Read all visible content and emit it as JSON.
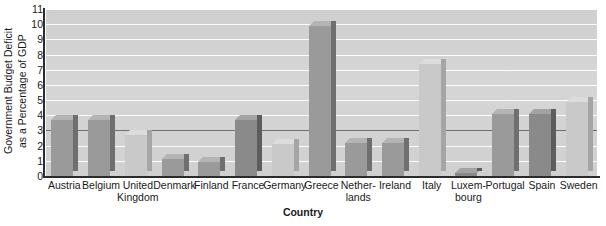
{
  "chart_data": {
    "type": "bar",
    "title": "",
    "xlabel": "Country",
    "ylabel": "Government Budget Deficit as a Percentage of GDP",
    "ylabel_line1": "Government Budget Deficit",
    "ylabel_line2": "as a Percentage of GDP",
    "ylim": [
      0,
      11
    ],
    "ytick_labels": [
      "0",
      "1",
      "2",
      "3",
      "4",
      "5",
      "6",
      "7",
      "8",
      "9",
      "10",
      "11"
    ],
    "ytick_values": [
      0,
      1,
      2,
      3,
      4,
      5,
      6,
      7,
      8,
      9,
      10,
      11
    ],
    "grid": true,
    "legend": "none",
    "reference_line": 3,
    "categories": [
      "Austria",
      "Belgium",
      "United Kingdom",
      "Denmark",
      "Finland",
      "France",
      "Germany",
      "Greece",
      "Netherlands",
      "Ireland",
      "Italy",
      "Luxembourg",
      "Portugal",
      "Spain",
      "Sweden"
    ],
    "category_lines": [
      [
        "Austria"
      ],
      [
        "Belgium"
      ],
      [
        "United",
        "Kingdom"
      ],
      [
        "Denmark"
      ],
      [
        "Finland"
      ],
      [
        "France"
      ],
      [
        "Germany"
      ],
      [
        "Greece"
      ],
      [
        "Nether-",
        "lands"
      ],
      [
        "Ireland"
      ],
      [
        "Italy"
      ],
      [
        "Luxem-",
        "bourg"
      ],
      [
        "Portugal"
      ],
      [
        "Spain"
      ],
      [
        "Sweden"
      ]
    ],
    "values": [
      3.7,
      3.7,
      2.7,
      1.1,
      0.9,
      3.7,
      2.1,
      9.9,
      2.2,
      2.2,
      7.4,
      0.1,
      4.1,
      4.1,
      4.9
    ],
    "bar_shades": [
      "medium",
      "medium",
      "light",
      "medium",
      "medium",
      "dark",
      "light",
      "medium",
      "medium",
      "medium",
      "light",
      "dark",
      "medium",
      "dark",
      "light"
    ]
  },
  "colors": {
    "plot_background": "#d2d2d2",
    "gridline": "#fdfdfd",
    "reference_line": "#6e6e6e",
    "axis": "#2b2b2b",
    "bar_light_face": "#c9c9c9",
    "bar_light_top": "#dcdcdc",
    "bar_light_side": "#a5a5a5",
    "bar_medium_face": "#9a9a9a",
    "bar_medium_top": "#b4b4b4",
    "bar_medium_side": "#6f6f6f",
    "bar_dark_face": "#8a8a8a",
    "bar_dark_top": "#a3a3a3",
    "bar_dark_side": "#5d5d5d",
    "text": "#1a1a1a"
  }
}
